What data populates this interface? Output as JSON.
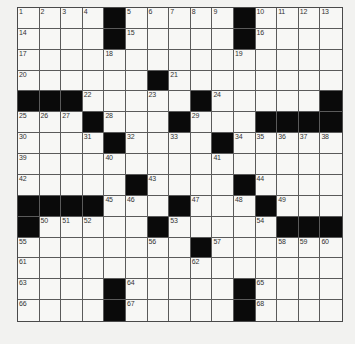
{
  "puzzle": {
    "rows": 15,
    "cols": 15,
    "grid": [
      [
        "1",
        "2",
        "3",
        "4",
        "#",
        "5",
        "6",
        "7",
        "8",
        "9",
        "#",
        "10",
        "11",
        "12",
        "13"
      ],
      [
        "14",
        "",
        "",
        "",
        "#",
        "15",
        "",
        "",
        "",
        "",
        "#",
        "16",
        "",
        "",
        ""
      ],
      [
        "17",
        "",
        "",
        "",
        "18",
        "",
        "",
        "",
        "",
        "",
        "19",
        "",
        "",
        "",
        ""
      ],
      [
        "20",
        "",
        "",
        "",
        "",
        "",
        "#",
        "21",
        "",
        "",
        "",
        "",
        "",
        "",
        ""
      ],
      [
        "#",
        "#",
        "#",
        "22",
        "",
        "",
        "23",
        "",
        "#",
        "24",
        "",
        "",
        "",
        "",
        "#"
      ],
      [
        "25",
        "26",
        "27",
        "#",
        "28",
        "",
        "",
        "#",
        "29",
        "",
        "",
        "#",
        "#",
        "#",
        "#"
      ],
      [
        "30",
        "",
        "",
        "31",
        "#",
        "32",
        "",
        "33",
        "",
        "#",
        "34",
        "35",
        "36",
        "37",
        "38"
      ],
      [
        "39",
        "",
        "",
        "",
        "40",
        "",
        "",
        "",
        "",
        "41",
        "",
        "",
        "",
        "",
        ""
      ],
      [
        "42",
        "",
        "",
        "",
        "",
        "#",
        "43",
        "",
        "",
        "",
        "#",
        "44",
        "",
        "",
        ""
      ],
      [
        "#",
        "#",
        "#",
        "#",
        "45",
        "46",
        "",
        "#",
        "47",
        "",
        "48",
        "#",
        "49",
        "",
        ""
      ],
      [
        "#",
        "50",
        "51",
        "52",
        "",
        "",
        "#",
        "53",
        "",
        "",
        "",
        "54",
        "#",
        "#",
        "#"
      ],
      [
        "55",
        "",
        "",
        "",
        "",
        "",
        "56",
        "",
        "#",
        "57",
        "",
        "",
        "58",
        "59",
        "60"
      ],
      [
        "61",
        "",
        "",
        "",
        "",
        "",
        "",
        "",
        "62",
        "",
        "",
        "",
        "",
        "",
        ""
      ],
      [
        "63",
        "",
        "",
        "",
        "#",
        "64",
        "",
        "",
        "",
        "",
        "#",
        "65",
        "",
        "",
        ""
      ],
      [
        "66",
        "",
        "",
        "",
        "#",
        "67",
        "",
        "",
        "",
        "",
        "#",
        "68",
        "",
        "",
        ""
      ]
    ],
    "colors": {
      "block": "#0a0a0a",
      "cell": "#f7f7f5",
      "line": "#5a5a5a",
      "background": "#f2f2f0"
    }
  }
}
